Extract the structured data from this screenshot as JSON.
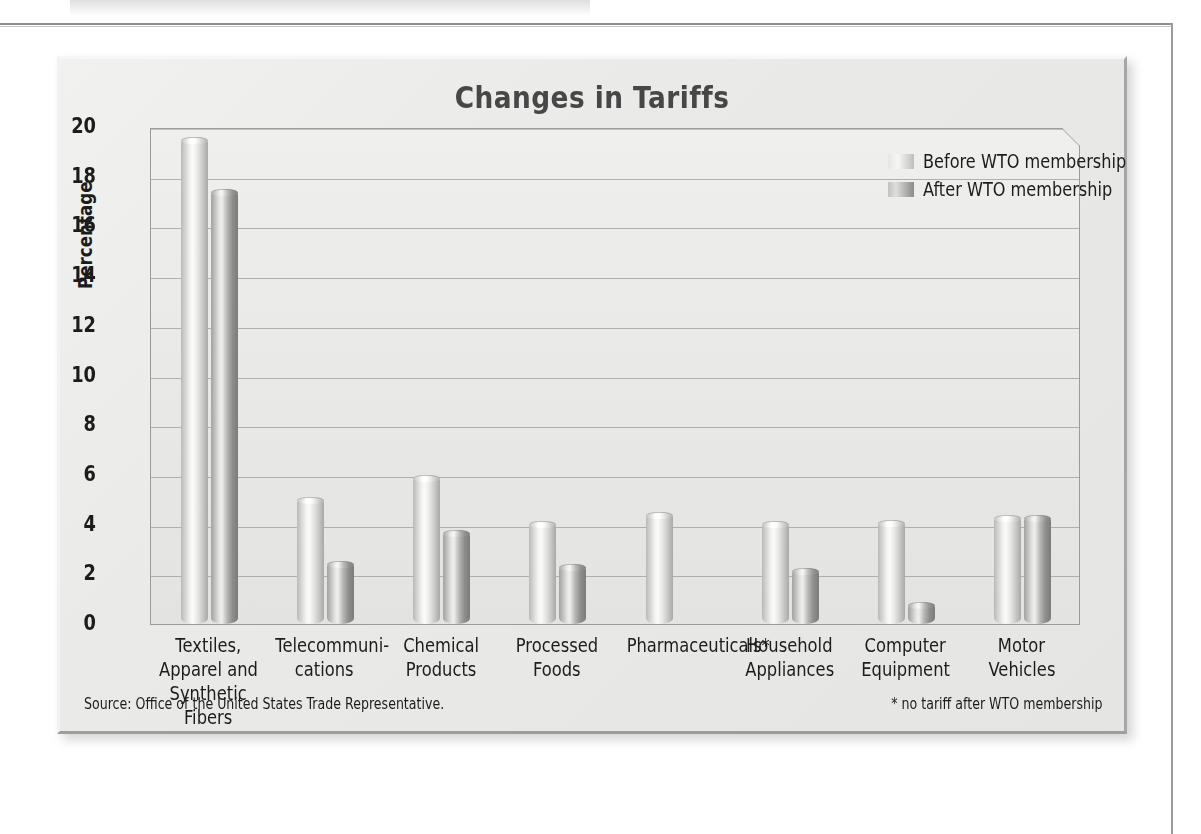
{
  "chart_data": {
    "type": "bar",
    "title": "Changes in Tariffs",
    "xlabel": "",
    "ylabel": "Percentage",
    "ylim": [
      0,
      20
    ],
    "ytick_step": 2,
    "yticks": [
      "20",
      "18",
      "16",
      "14",
      "12",
      "10",
      "8",
      "6",
      "4",
      "2",
      "0"
    ],
    "grid": true,
    "legend_position": "top-right",
    "categories": [
      "Textiles,\nApparel and\nSynthetic Fibers",
      "Telecommuni-\ncations",
      "Chemical\nProducts",
      "Processed\nFoods",
      "Pharmaceuticals*",
      "Household\nAppliances",
      "Computer\nEquipment",
      "Motor\nVehicles"
    ],
    "series": [
      {
        "name": "Before WTO membership",
        "color": "#e6e6e4",
        "values": [
          19.6,
          5.1,
          6.0,
          4.15,
          4.5,
          4.15,
          4.2,
          4.4
        ]
      },
      {
        "name": "After WTO membership",
        "color": "#8b8b89",
        "values": [
          17.5,
          2.55,
          3.8,
          2.4,
          null,
          2.25,
          0.9,
          4.4
        ]
      }
    ],
    "annotations": {
      "source": "Source: Office of the United States Trade Representative.",
      "footnote": "* no tariff after WTO membership"
    }
  },
  "chart": {
    "title": "Changes in Tariffs",
    "y_axis_title": "Percentage"
  },
  "legend": {
    "items": [
      {
        "label": "Before WTO membership"
      },
      {
        "label": "After WTO membership"
      }
    ]
  },
  "footer": {
    "source": "Source: Office of the United States Trade Representative.",
    "footnote": "* no tariff after WTO membership"
  },
  "colors": {
    "panel_background": "#e9e9e7",
    "plot_background": "#e9e9e7",
    "title_text": "#474747",
    "axis_text": "#1c1c1c",
    "gridline": "#9c9c9c",
    "bar_before": "#e6e6e4",
    "bar_after": "#8b8b89"
  }
}
